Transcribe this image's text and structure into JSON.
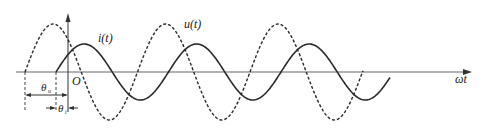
{
  "diagram": {
    "type": "phase-shift waveform",
    "labels": {
      "current": "i(t)",
      "voltage": "u(t)",
      "origin": "O",
      "x_axis": "ωt",
      "theta_u": "θ",
      "theta_u_sub": "u",
      "theta_i": "θ",
      "theta_i_sub": "i"
    },
    "series": [
      {
        "name": "u(t)",
        "style": "dashed",
        "amplitude": 48,
        "phase_start_x": 25,
        "period": 112.5,
        "end_x": 363
      },
      {
        "name": "i(t)",
        "style": "solid",
        "amplitude": 28,
        "phase_start_x": 56,
        "period": 112.5,
        "end_x": 390
      }
    ],
    "colors": {
      "stroke": "#2a2a2a",
      "axis": "#555555"
    }
  }
}
